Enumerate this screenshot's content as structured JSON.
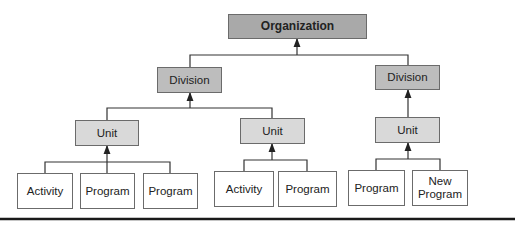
{
  "diagram": {
    "organization": {
      "label": "Organization"
    },
    "divisions": [
      {
        "label": "Division"
      },
      {
        "label": "Division"
      }
    ],
    "units": [
      {
        "label": "Unit"
      },
      {
        "label": "Unit"
      },
      {
        "label": "Unit"
      }
    ],
    "leaves": [
      {
        "label": "Activity"
      },
      {
        "label": "Program"
      },
      {
        "label": "Program"
      },
      {
        "label": "Activity"
      },
      {
        "label": "Program"
      },
      {
        "label": "Program"
      },
      {
        "label": "New Program"
      }
    ],
    "colors": {
      "organization_fill": "#a9a9a9",
      "division_fill": "#bdbdbd",
      "unit_fill": "#d9d9d9",
      "leaf_fill": "#ffffff",
      "line": "#333333"
    }
  }
}
